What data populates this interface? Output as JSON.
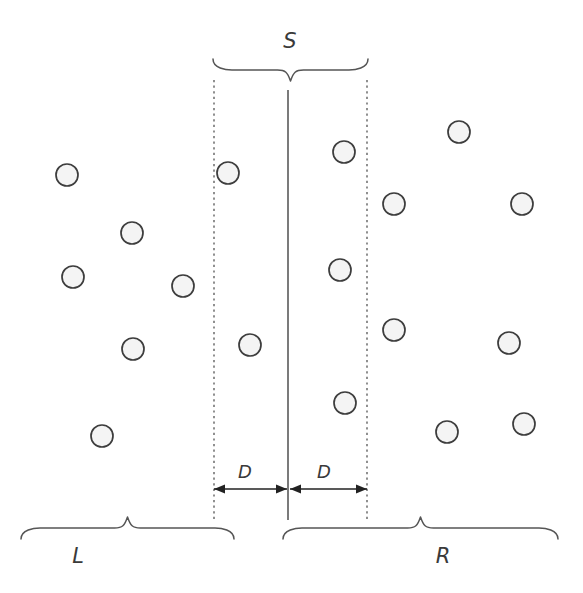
{
  "figure": {
    "width": 583,
    "height": 593,
    "background_color": "#ffffff"
  },
  "labels": {
    "span_top": "S",
    "dim_left": "D",
    "dim_right": "D",
    "region_left": "L",
    "region_right": "R"
  },
  "colors": {
    "point_fill": "#f4f4f4",
    "point_stroke": "#3d3d3d",
    "line": "#4a4a4a",
    "dotted": "#555555",
    "arrow": "#222222",
    "text": "#3a3a3a"
  },
  "geometry": {
    "center_line": {
      "x": 288,
      "y_top": 90,
      "y_bottom": 520
    },
    "dotted_left": {
      "x": 214,
      "y_top": 80,
      "y_bottom": 520
    },
    "dotted_right": {
      "x": 367,
      "y_top": 80,
      "y_bottom": 520
    },
    "brace_top": {
      "x_start": 213,
      "x_end": 368,
      "y": 70,
      "label_x": 290,
      "label_y": 48
    },
    "brace_left": {
      "x_start": 21,
      "x_end": 234,
      "y": 528,
      "label_x": 78,
      "label_y": 563
    },
    "brace_right": {
      "x_start": 283,
      "x_end": 558,
      "y": 528,
      "label_x": 443,
      "label_y": 563
    },
    "dim_left_arrow": {
      "x_start": 214,
      "x_end": 287,
      "y": 489,
      "label_x": 245,
      "label_y": 478
    },
    "dim_right_arrow": {
      "x_start": 290,
      "x_end": 367,
      "y": 489,
      "label_x": 324,
      "label_y": 478
    }
  },
  "chart_data": {
    "type": "scatter",
    "xlabel": "",
    "ylabel": "",
    "xlim": [
      0,
      583
    ],
    "ylim": [
      0,
      593
    ],
    "grid": false,
    "legend": null,
    "marker": {
      "shape": "circle",
      "radius": 11,
      "fill": "#f4f4f4",
      "edge": "#3d3d3d"
    },
    "annotations": [
      {
        "text": "S",
        "type": "brace",
        "x": 290,
        "y": 48,
        "span": [
          213,
          368
        ]
      },
      {
        "text": "D",
        "type": "dimension",
        "x": 245,
        "y": 478,
        "span": [
          214,
          287
        ]
      },
      {
        "text": "D",
        "type": "dimension",
        "x": 324,
        "y": 478,
        "span": [
          290,
          367
        ]
      },
      {
        "text": "L",
        "type": "brace",
        "x": 78,
        "y": 563,
        "span": [
          21,
          234
        ]
      },
      {
        "text": "R",
        "type": "brace",
        "x": 443,
        "y": 563,
        "span": [
          283,
          558
        ]
      }
    ],
    "series": [
      {
        "name": "points",
        "points": [
          {
            "x": 67,
            "y": 175,
            "region": "L"
          },
          {
            "x": 132,
            "y": 233,
            "region": "L"
          },
          {
            "x": 73,
            "y": 277,
            "region": "L"
          },
          {
            "x": 183,
            "y": 286,
            "region": "L"
          },
          {
            "x": 133,
            "y": 349,
            "region": "L"
          },
          {
            "x": 102,
            "y": 436,
            "region": "L"
          },
          {
            "x": 228,
            "y": 173,
            "region": "S-left"
          },
          {
            "x": 250,
            "y": 345,
            "region": "S-left"
          },
          {
            "x": 344,
            "y": 152,
            "region": "S-right"
          },
          {
            "x": 340,
            "y": 270,
            "region": "S-right"
          },
          {
            "x": 345,
            "y": 403,
            "region": "S-right"
          },
          {
            "x": 459,
            "y": 132,
            "region": "R"
          },
          {
            "x": 394,
            "y": 204,
            "region": "R"
          },
          {
            "x": 522,
            "y": 204,
            "region": "R"
          },
          {
            "x": 394,
            "y": 330,
            "region": "R"
          },
          {
            "x": 509,
            "y": 343,
            "region": "R"
          },
          {
            "x": 447,
            "y": 432,
            "region": "R"
          },
          {
            "x": 524,
            "y": 424,
            "region": "R"
          }
        ]
      }
    ]
  }
}
